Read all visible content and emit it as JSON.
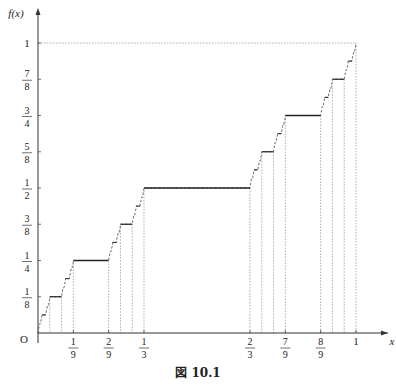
{
  "caption": "図 10.1",
  "chart_data": {
    "type": "line",
    "xlabel": "x",
    "ylabel": "f(x)",
    "origin_label": "O",
    "xlim": [
      0,
      1
    ],
    "ylim": [
      0,
      1
    ],
    "x_ticks": [
      {
        "value": 0.1111,
        "num": "1",
        "den": "9"
      },
      {
        "value": 0.2222,
        "num": "2",
        "den": "9"
      },
      {
        "value": 0.3333,
        "num": "1",
        "den": "3"
      },
      {
        "value": 0.6667,
        "num": "2",
        "den": "3"
      },
      {
        "value": 0.7778,
        "num": "7",
        "den": "9"
      },
      {
        "value": 0.8889,
        "num": "8",
        "den": "9"
      },
      {
        "value": 1.0,
        "num": "1",
        "den": ""
      }
    ],
    "y_ticks": [
      {
        "value": 0.125,
        "num": "1",
        "den": "8"
      },
      {
        "value": 0.25,
        "num": "1",
        "den": "4"
      },
      {
        "value": 0.375,
        "num": "3",
        "den": "8"
      },
      {
        "value": 0.5,
        "num": "1",
        "den": "2"
      },
      {
        "value": 0.625,
        "num": "5",
        "den": "8"
      },
      {
        "value": 0.75,
        "num": "3",
        "den": "4"
      },
      {
        "value": 0.875,
        "num": "7",
        "den": "8"
      },
      {
        "value": 1.0,
        "num": "1",
        "den": ""
      }
    ],
    "flat_segments": [
      {
        "x0": 0.3333,
        "x1": 0.6667,
        "y": 0.5,
        "level": 1
      },
      {
        "x0": 0.1111,
        "x1": 0.2222,
        "y": 0.25,
        "level": 2
      },
      {
        "x0": 0.7778,
        "x1": 0.8889,
        "y": 0.75,
        "level": 2
      },
      {
        "x0": 0.037,
        "x1": 0.0741,
        "y": 0.125,
        "level": 3
      },
      {
        "x0": 0.2593,
        "x1": 0.2963,
        "y": 0.375,
        "level": 3
      },
      {
        "x0": 0.7037,
        "x1": 0.7407,
        "y": 0.625,
        "level": 3
      },
      {
        "x0": 0.9259,
        "x1": 0.963,
        "y": 0.875,
        "level": 3
      }
    ],
    "reference_lines": {
      "y1_dotted_to_x": 1,
      "x1_dotted_to_y": 1
    },
    "grid": false
  }
}
